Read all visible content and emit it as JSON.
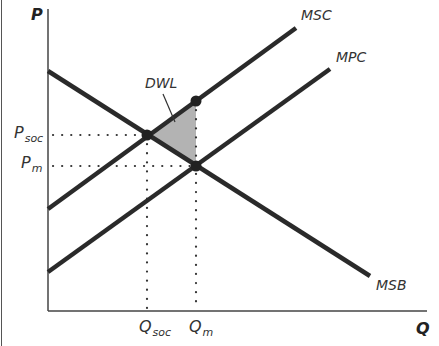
{
  "diagram": {
    "type": "externality-welfare-diagram",
    "axes": {
      "y_label": "P",
      "x_label": "Q"
    },
    "curves": [
      {
        "id": "msc",
        "label": "MSC",
        "from": [
          48,
          209
        ],
        "to": [
          296,
          28
        ]
      },
      {
        "id": "mpc",
        "label": "MPC",
        "from": [
          48,
          272
        ],
        "to": [
          330,
          69
        ]
      },
      {
        "id": "msb",
        "label": "MSB",
        "from": [
          48,
          71
        ],
        "to": [
          370,
          276
        ]
      }
    ],
    "points": {
      "social_optimum": [
        147,
        135
      ],
      "msc_at_qm": [
        196,
        101
      ],
      "market_equilibrium": [
        196,
        166
      ]
    },
    "price_labels": {
      "p_soc": {
        "main": "P",
        "sub": "soc"
      },
      "p_m": {
        "main": "P",
        "sub": "m"
      }
    },
    "quantity_labels": {
      "q_soc": {
        "main": "Q",
        "sub": "soc"
      },
      "q_m": {
        "main": "Q",
        "sub": "m"
      }
    },
    "annotation": {
      "dwl_label": "DWL"
    },
    "colors": {
      "line": "#2a2a2a",
      "axis": "#444444",
      "dwl_fill": "#b3b3b3",
      "dots": "#333333"
    }
  }
}
